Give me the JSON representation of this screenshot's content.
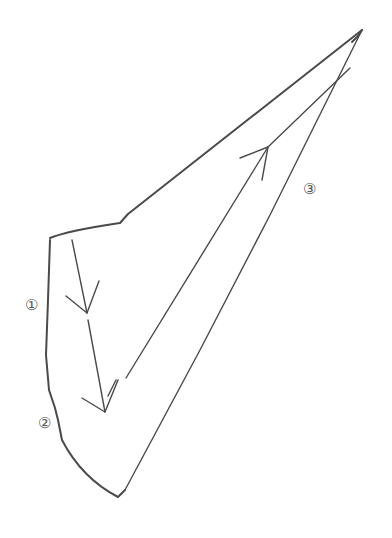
{
  "diagram": {
    "labels": [
      {
        "id": "1",
        "text": "①",
        "x": 22,
        "y": 296
      },
      {
        "id": "2",
        "text": "②",
        "x": 35,
        "y": 414
      },
      {
        "id": "3",
        "text": "③",
        "x": 300,
        "y": 180
      }
    ],
    "stroke_color": "#4a4a4a",
    "outline": {
      "top_edge": [
        [
          50,
          238
        ],
        [
          120,
          222
        ],
        [
          128,
          213
        ],
        [
          362,
          30
        ]
      ],
      "left_edge": [
        [
          50,
          238
        ],
        [
          47,
          310
        ],
        [
          46,
          360
        ],
        [
          50,
          400
        ],
        [
          55,
          410
        ],
        [
          60,
          440
        ],
        [
          90,
          480
        ],
        [
          118,
          497
        ],
        [
          127,
          488
        ],
        [
          362,
          30
        ]
      ]
    },
    "arrows": [
      {
        "id": "down-arrow-1",
        "from": [
          72,
          240
        ],
        "to": [
          87,
          313
        ]
      },
      {
        "id": "down-arrow-2",
        "from": [
          88,
          320
        ],
        "to": [
          105,
          412
        ]
      },
      {
        "id": "up-arrow-3",
        "from": [
          130,
          370
        ],
        "to": [
          268,
          147
        ]
      }
    ]
  }
}
